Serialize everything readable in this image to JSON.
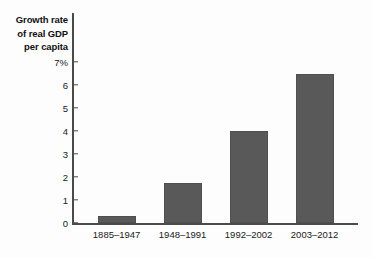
{
  "chart_data": {
    "type": "bar",
    "title": "Growth rate of real GDP per capita",
    "title_lines": [
      "Growth rate",
      "of real GDP",
      "per capita"
    ],
    "xlabel": "",
    "ylabel": "Growth rate of real GDP per capita",
    "categories": [
      "1885–1947",
      "1948–1991",
      "1992–2002",
      "2003–2012"
    ],
    "values": [
      0.3,
      1.75,
      4.0,
      6.5
    ],
    "ylim": [
      0,
      7
    ],
    "ytick_values": [
      0,
      1,
      2,
      3,
      4,
      5,
      6,
      7
    ],
    "ytick_labels": [
      "0",
      "1",
      "2",
      "3",
      "4",
      "5",
      "6",
      "7%"
    ],
    "units": "percent",
    "grid": false,
    "legend": false,
    "bar_color": "#595959",
    "axis_color": "#4a4a4a",
    "background_color": "#fdfdfd"
  }
}
